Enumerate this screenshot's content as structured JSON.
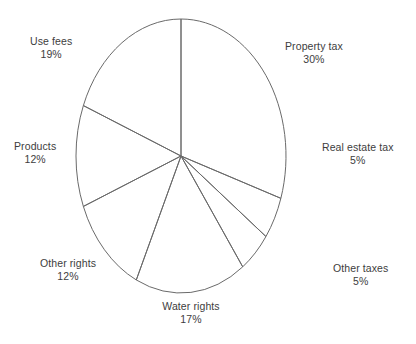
{
  "chart_data": {
    "type": "pie",
    "title": "",
    "subtitle": "",
    "xlabel": "",
    "ylabel": "",
    "legend_position": "none",
    "grid": false,
    "start_angle_deg": 0,
    "direction": "clockwise",
    "value_unit": "percent",
    "total": 100,
    "categories": [
      "Property tax",
      "Real estate tax",
      "Other taxes",
      "Water rights",
      "Other rights",
      "Products",
      "Use fees"
    ],
    "values": [
      30,
      5,
      5,
      17,
      12,
      12,
      19
    ],
    "labels": [
      "Property tax 30%",
      "Real estate tax 5%",
      "Other taxes 5%",
      "Water rights 17%",
      "Other rights 12%",
      "Products 12%",
      "Use fees 19%"
    ],
    "slices": [
      {
        "name": "Property tax",
        "percent_text": "30%",
        "value": 30,
        "label_x": 285,
        "label_y": 40,
        "align": "left"
      },
      {
        "name": "Real estate tax",
        "percent_text": "5%",
        "value": 5,
        "label_x": 322,
        "label_y": 141,
        "align": "left"
      },
      {
        "name": "Other taxes",
        "percent_text": "5%",
        "value": 5,
        "label_x": 333,
        "label_y": 262,
        "align": "left"
      },
      {
        "name": "Water rights",
        "percent_text": "17%",
        "value": 17,
        "label_x": 191,
        "label_y": 300,
        "align": "center"
      },
      {
        "name": "Other rights",
        "percent_text": "12%",
        "value": 12,
        "label_x": 40,
        "label_y": 257,
        "align": "right"
      },
      {
        "name": "Products",
        "percent_text": "12%",
        "value": 12,
        "label_x": 14,
        "label_y": 140,
        "align": "right"
      },
      {
        "name": "Use fees",
        "percent_text": "19%",
        "value": 19,
        "label_x": 30,
        "label_y": 35,
        "align": "right"
      }
    ],
    "geometry": {
      "center_x": 181,
      "center_y": 156,
      "radius_x": 105,
      "radius_y": 137
    },
    "colors": {
      "background": "#ffffff",
      "stroke": "#6a6a6a",
      "text": "#3d3d3d"
    }
  }
}
